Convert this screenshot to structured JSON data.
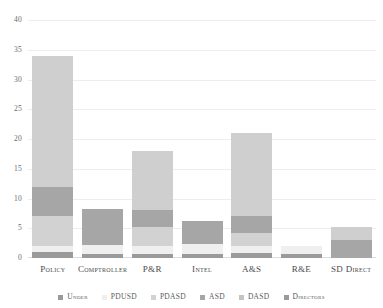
{
  "chart_data": {
    "type": "bar",
    "stacked": true,
    "title": "",
    "subtitle": "",
    "xlabel": "",
    "ylabel": "",
    "ylim": [
      0,
      40
    ],
    "yticks": [
      0,
      5,
      10,
      15,
      20,
      25,
      30,
      35,
      40
    ],
    "ytick_labels": [
      "0",
      "5",
      "10",
      "15",
      "20",
      "25",
      "30",
      "35",
      "40"
    ],
    "grid": true,
    "legend_position": "bottom",
    "categories": [
      "Policy",
      "Comptroller",
      "P&R",
      "Intel",
      "A&S",
      "R&E",
      "SD Direct"
    ],
    "series": [
      {
        "name": "Under",
        "color": "#9a9a9a",
        "values": [
          1.0,
          0.7,
          0.7,
          0.7,
          0.8,
          0.7,
          0.0
        ]
      },
      {
        "name": "PDUSD",
        "color": "#efefef",
        "values": [
          1.0,
          1.5,
          1.3,
          1.6,
          1.2,
          1.3,
          0.0
        ]
      },
      {
        "name": "PDASD",
        "color": "#d2d2d2",
        "values": [
          5.0,
          0.0,
          3.2,
          0.0,
          2.2,
          0.0,
          0.0
        ]
      },
      {
        "name": "ASD",
        "color": "#a6a6a6",
        "values": [
          0.0,
          6.0,
          2.8,
          4.0,
          2.8,
          0.0,
          3.0
        ]
      },
      {
        "name": "DASD",
        "color": "#a6a6a6",
        "values": [
          5.0,
          0.0,
          0.0,
          0.0,
          0.0,
          0.0,
          0.0
        ]
      },
      {
        "name": "Directors",
        "color": "#cfcfcf",
        "values": [
          22.0,
          0.0,
          10.0,
          0.0,
          14.0,
          0.0,
          2.2
        ]
      }
    ],
    "totals": [
      34,
      8.2,
      18,
      6.3,
      21,
      2.0,
      5.2
    ]
  },
  "legend": {
    "items": [
      {
        "label": "Under",
        "swatch_color": "#9a9a9a"
      },
      {
        "label": "PDUSD",
        "swatch_color": "#efefef"
      },
      {
        "label": "PDASD",
        "swatch_color": "#d2d2d2"
      },
      {
        "label": "ASD",
        "swatch_color": "#a6a6a6"
      },
      {
        "label": "DASD",
        "swatch_color": "#c4c4c4"
      },
      {
        "label": "Directors",
        "swatch_color": "#9a9a9a"
      }
    ]
  },
  "colors": {
    "background": "#ffffff",
    "gridline": "#e9eef2",
    "axis_text": "#6b6b6b",
    "category_text": "#4a4a4a"
  }
}
